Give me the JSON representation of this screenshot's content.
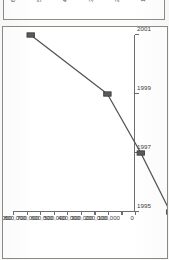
{
  "page": {
    "orientation": "rotated-90-ccw",
    "background_color": "#fcfcfb",
    "frame_color": "#8a8a8a"
  },
  "upper_figure": {
    "description": "bottom sliver of the preceding figure on the page",
    "tick_labels": [
      "60",
      "50",
      "40",
      "30",
      "20",
      "10"
    ]
  },
  "chart_data": {
    "type": "line",
    "title": "",
    "subtitle": "",
    "xlabel": "",
    "ylabel": "",
    "categories": [
      "1995",
      "1997",
      "1999",
      "2001"
    ],
    "x": [
      1995,
      1997,
      1999,
      2001
    ],
    "values": [
      100000,
      250000,
      420000,
      810000
    ],
    "series": [
      {
        "name": "",
        "values": [
          100000,
          250000,
          420000,
          810000
        ],
        "line_color": "#555555",
        "marker_color": "#5a5a5a",
        "marker_shape": "square"
      }
    ],
    "ylim": [
      0,
      900000
    ],
    "ytick_values": [
      0,
      100000,
      200000,
      300000,
      400000,
      500000,
      600000,
      700000,
      800000,
      900000
    ],
    "ytick_labels": [
      "0",
      "100,000",
      "200,000",
      "300,000",
      "400,000",
      "500,000",
      "600,000",
      "700,000",
      "800,000",
      "900,000"
    ],
    "xtick_labels": [
      "1995",
      "1997",
      "1999",
      "2001"
    ],
    "grid": false,
    "legend": false,
    "legend_position": "none",
    "annotations": []
  },
  "colors": {
    "axis": "#6d6d6d",
    "text": "#3a3a3a",
    "series": "#555555",
    "frame": "#8a8a8a"
  }
}
